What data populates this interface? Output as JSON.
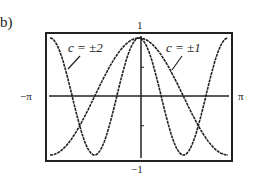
{
  "figure": {
    "label": "b)"
  },
  "chart_data": {
    "type": "line",
    "title": "",
    "xlabel": "",
    "ylabel": "",
    "xlim": [
      -3.14159,
      3.14159
    ],
    "ylim": [
      -1,
      1
    ],
    "x_tick_labels": {
      "left": "−π",
      "right": "π"
    },
    "y_tick_labels": {
      "top": "1",
      "bottom": "−1"
    },
    "grid": false,
    "legend": "none",
    "series": [
      {
        "name": "c = ±1",
        "function": "cos(x)",
        "annotation": "c = ±1",
        "x": [
          -3.1416,
          -2.3562,
          -1.5708,
          -0.7854,
          0,
          0.7854,
          1.5708,
          2.3562,
          3.1416
        ],
        "values": [
          -1,
          -0.707,
          0,
          0.707,
          1,
          0.707,
          0,
          -0.707,
          -1
        ]
      },
      {
        "name": "c = ±2",
        "function": "cos(2x)",
        "annotation": "c = ±2",
        "x": [
          -3.1416,
          -2.3562,
          -1.5708,
          -0.7854,
          0,
          0.7854,
          1.5708,
          2.3562,
          3.1416
        ],
        "values": [
          1,
          0,
          -1,
          0,
          1,
          0,
          -1,
          0,
          1
        ]
      }
    ]
  }
}
